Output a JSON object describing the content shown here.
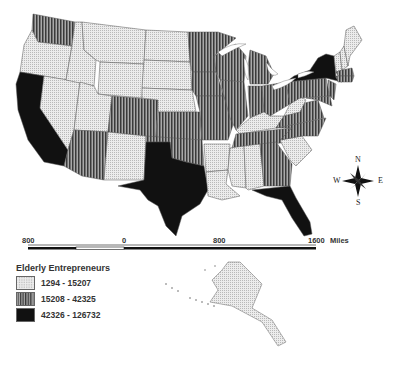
{
  "map": {
    "title": "Elderly Entrepreneurs",
    "region": "United States",
    "legend": {
      "title": "Elderly Entrepreneurs",
      "classes": [
        {
          "label": "1294 - 15207",
          "pattern": "dotted-light",
          "color": "#e6e6e6"
        },
        {
          "label": "15208 - 42325",
          "pattern": "vertical-stripes",
          "color": "#6a6a6a"
        },
        {
          "label": "42326 - 126732",
          "pattern": "solid",
          "color": "#111111"
        }
      ]
    },
    "scalebar": {
      "labels": [
        "800",
        "0",
        "800",
        "1600"
      ],
      "units": "Miles"
    },
    "compass": {
      "n": "N",
      "s": "S",
      "e": "E",
      "w": "W"
    },
    "states_by_class": {
      "1294 - 15207": [
        "OR",
        "ID",
        "MT",
        "WY",
        "NV",
        "UT",
        "ND",
        "SD",
        "NE",
        "NM",
        "AR",
        "LA",
        "MS",
        "AL",
        "KY",
        "SC",
        "ME",
        "NH",
        "VT",
        "WV",
        "AK"
      ],
      "15208 - 42325": [
        "WA",
        "AZ",
        "CO",
        "KS",
        "OK",
        "MN",
        "IA",
        "MO",
        "WI",
        "IL",
        "MI",
        "IN",
        "OH",
        "TN",
        "GA",
        "NC",
        "VA",
        "PA",
        "NJ",
        "MA",
        "CT",
        "MD"
      ],
      "42326 - 126732": [
        "CA",
        "TX",
        "FL",
        "NY"
      ]
    }
  }
}
